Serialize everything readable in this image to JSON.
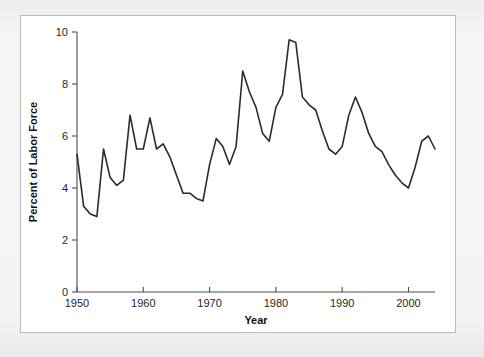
{
  "figure": {
    "panel_background": "#ffffff",
    "page_background": "#f2f2f2",
    "border_color": "#b9b9b9"
  },
  "chart_data": {
    "type": "line",
    "title": "",
    "xlabel": "Year",
    "ylabel": "Percent of Labor Force",
    "xlim": [
      1950,
      2004
    ],
    "ylim": [
      0,
      10
    ],
    "grid": false,
    "legend": null,
    "line_color": "#2b2b2b",
    "xticks": [
      1950,
      1960,
      1970,
      1980,
      1990,
      2000
    ],
    "xtick_labels": [
      "1950",
      "1960",
      "1970",
      "1980",
      "1990",
      "2000"
    ],
    "yticks": [
      0,
      2,
      4,
      6,
      8,
      10
    ],
    "ytick_labels": [
      "0",
      "2",
      "4",
      "6",
      "8",
      "10"
    ],
    "series": [
      {
        "name": "Unemployment rate",
        "x": [
          1950,
          1951,
          1952,
          1953,
          1954,
          1955,
          1956,
          1957,
          1958,
          1959,
          1960,
          1961,
          1962,
          1963,
          1964,
          1965,
          1966,
          1967,
          1968,
          1969,
          1970,
          1971,
          1972,
          1973,
          1974,
          1975,
          1976,
          1977,
          1978,
          1979,
          1980,
          1981,
          1982,
          1983,
          1984,
          1985,
          1986,
          1987,
          1988,
          1989,
          1990,
          1991,
          1992,
          1993,
          1994,
          1995,
          1996,
          1997,
          1998,
          1999,
          2000,
          2001,
          2002,
          2003,
          2004
        ],
        "values": [
          5.3,
          3.3,
          3.0,
          2.9,
          5.5,
          4.4,
          4.1,
          4.3,
          6.8,
          5.5,
          5.5,
          6.7,
          5.5,
          5.7,
          5.2,
          4.5,
          3.8,
          3.8,
          3.6,
          3.5,
          4.9,
          5.9,
          5.6,
          4.9,
          5.6,
          8.5,
          7.7,
          7.1,
          6.1,
          5.8,
          7.1,
          7.6,
          9.7,
          9.6,
          7.5,
          7.2,
          7.0,
          6.2,
          5.5,
          5.3,
          5.6,
          6.8,
          7.5,
          6.9,
          6.1,
          5.6,
          5.4,
          4.9,
          4.5,
          4.2,
          4.0,
          4.8,
          5.8,
          6.0,
          5.5
        ]
      }
    ]
  }
}
